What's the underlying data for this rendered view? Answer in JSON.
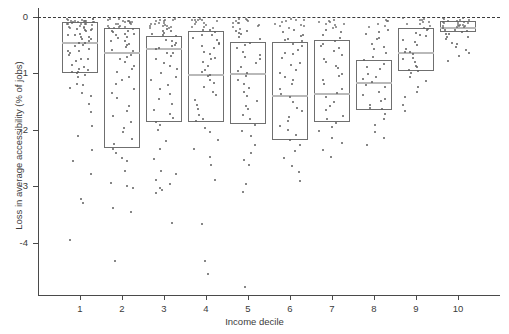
{
  "chart_data": {
    "type": "box",
    "title": "",
    "xlabel": "Income decile",
    "ylabel": "Loss in average accessibility (% of jobs)",
    "categories": [
      "1",
      "2",
      "3",
      "4",
      "5",
      "6",
      "7",
      "8",
      "9",
      "10"
    ],
    "xtick_labels": [
      "1",
      "2",
      "3",
      "4",
      "5",
      "6",
      "7",
      "8",
      "9",
      "10"
    ],
    "ytick_labels": [
      "0",
      "-1",
      "-2",
      "-3",
      "-4"
    ],
    "ytick_values": [
      0,
      -1,
      -2,
      -3,
      -4
    ],
    "ylim": [
      -4.9,
      0.15
    ],
    "xlim": [
      0.4,
      10.6
    ],
    "grid": false,
    "legend": null,
    "reference_lines": [
      {
        "axis": "y",
        "value": 0,
        "style": "dashed",
        "color": "#3b3b3b"
      }
    ],
    "overlay": "jittered scatter points of individual observations",
    "box_color": "#6f6f6f",
    "median_color": "#b9b9b9",
    "point_color": "#5e5e5e",
    "boxes": [
      {
        "category": "1",
        "q3": -0.09,
        "median": -0.45,
        "q1": -0.99
      },
      {
        "category": "2",
        "q3": -0.2,
        "median": -0.62,
        "q1": -2.32
      },
      {
        "category": "3",
        "q3": -0.34,
        "median": -0.55,
        "q1": -1.86
      },
      {
        "category": "4",
        "q3": -0.25,
        "median": -1.01,
        "q1": -1.86
      },
      {
        "category": "5",
        "q3": -0.45,
        "median": -0.99,
        "q1": -1.9
      },
      {
        "category": "6",
        "q3": -0.44,
        "median": -1.38,
        "q1": -2.18
      },
      {
        "category": "7",
        "q3": -0.41,
        "median": -1.35,
        "q1": -1.86
      },
      {
        "category": "8",
        "q3": -0.76,
        "median": -1.15,
        "q1": -1.65
      },
      {
        "category": "9",
        "q3": -0.2,
        "median": -0.62,
        "q1": -0.96
      },
      {
        "category": "10",
        "q3": -0.07,
        "median": -0.18,
        "q1": -0.27
      }
    ],
    "points": {
      "1": [
        -0.02,
        -0.03,
        -0.04,
        -0.05,
        -0.05,
        -0.06,
        -0.07,
        -0.07,
        -0.08,
        -0.08,
        -0.09,
        -0.09,
        -0.1,
        -0.1,
        -0.11,
        -0.12,
        -0.12,
        -0.13,
        -0.14,
        -0.15,
        -0.15,
        -0.16,
        -0.17,
        -0.18,
        -0.19,
        -0.2,
        -0.21,
        -0.22,
        -0.23,
        -0.25,
        -0.26,
        -0.28,
        -0.3,
        -0.32,
        -0.34,
        -0.36,
        -0.38,
        -0.4,
        -0.42,
        -0.45,
        -0.47,
        -0.5,
        -0.53,
        -0.56,
        -0.58,
        -0.61,
        -0.64,
        -0.68,
        -0.72,
        -0.76,
        -0.8,
        -0.85,
        -0.9,
        -0.93,
        -0.95,
        -0.97,
        -0.99,
        -1.0,
        -1.02,
        -1.05,
        -1.18,
        -1.22,
        -1.27,
        -1.35,
        -1.4,
        -1.52,
        -1.7,
        -1.95,
        -2.1,
        -2.35,
        -2.55,
        -2.78,
        -3.22,
        -3.27,
        -3.95
      ],
      "2": [
        -0.03,
        -0.04,
        -0.05,
        -0.06,
        -0.07,
        -0.08,
        -0.08,
        -0.09,
        -0.1,
        -0.11,
        -0.12,
        -0.13,
        -0.14,
        -0.15,
        -0.16,
        -0.17,
        -0.18,
        -0.19,
        -0.2,
        -0.21,
        -0.23,
        -0.25,
        -0.27,
        -0.29,
        -0.31,
        -0.33,
        -0.36,
        -0.38,
        -0.41,
        -0.44,
        -0.47,
        -0.5,
        -0.54,
        -0.58,
        -0.62,
        -0.66,
        -0.7,
        -0.75,
        -0.8,
        -0.86,
        -0.92,
        -0.98,
        -1.05,
        -1.12,
        -1.2,
        -1.28,
        -1.36,
        -1.45,
        -1.55,
        -1.65,
        -1.75,
        -1.86,
        -1.97,
        -2.05,
        -2.15,
        -2.25,
        -2.32,
        -2.4,
        -2.48,
        -2.56,
        -2.72,
        -2.95,
        -3.0,
        -3.05,
        -3.38,
        -3.45,
        -4.32
      ],
      "3": [
        -0.03,
        -0.04,
        -0.05,
        -0.06,
        -0.07,
        -0.08,
        -0.09,
        -0.1,
        -0.11,
        -0.12,
        -0.13,
        -0.14,
        -0.15,
        -0.16,
        -0.17,
        -0.18,
        -0.2,
        -0.22,
        -0.24,
        -0.26,
        -0.28,
        -0.3,
        -0.33,
        -0.36,
        -0.39,
        -0.42,
        -0.45,
        -0.48,
        -0.52,
        -0.55,
        -0.58,
        -0.62,
        -0.66,
        -0.7,
        -0.75,
        -0.8,
        -0.86,
        -0.92,
        -0.98,
        -1.05,
        -1.12,
        -1.2,
        -1.28,
        -1.36,
        -1.45,
        -1.54,
        -1.63,
        -1.72,
        -1.8,
        -1.86,
        -1.92,
        -2.0,
        -2.18,
        -2.35,
        -2.52,
        -2.72,
        -2.78,
        -2.88,
        -2.95,
        -3.02,
        -3.08,
        -3.12,
        -3.65
      ],
      "4": [
        -0.03,
        -0.04,
        -0.05,
        -0.06,
        -0.07,
        -0.08,
        -0.09,
        -0.1,
        -0.12,
        -0.14,
        -0.16,
        -0.18,
        -0.2,
        -0.22,
        -0.25,
        -0.28,
        -0.31,
        -0.34,
        -0.37,
        -0.4,
        -0.44,
        -0.48,
        -0.52,
        -0.56,
        -0.6,
        -0.65,
        -0.7,
        -0.75,
        -0.8,
        -0.86,
        -0.92,
        -0.98,
        -1.01,
        -1.06,
        -1.12,
        -1.18,
        -1.25,
        -1.32,
        -1.4,
        -1.48,
        -1.56,
        -1.64,
        -1.72,
        -1.8,
        -1.86,
        -1.95,
        -2.05,
        -2.18,
        -2.32,
        -2.48,
        -2.62,
        -2.9,
        -3.68,
        -4.3,
        -4.55
      ],
      "5": [
        -0.04,
        -0.05,
        -0.06,
        -0.07,
        -0.08,
        -0.09,
        -0.1,
        -0.12,
        -0.14,
        -0.16,
        -0.18,
        -0.2,
        -0.23,
        -0.26,
        -0.29,
        -0.32,
        -0.36,
        -0.4,
        -0.45,
        -0.5,
        -0.55,
        -0.6,
        -0.65,
        -0.7,
        -0.76,
        -0.82,
        -0.88,
        -0.94,
        -0.99,
        -1.05,
        -1.11,
        -1.18,
        -1.25,
        -1.32,
        -1.4,
        -1.48,
        -1.56,
        -1.64,
        -1.72,
        -1.8,
        -1.9,
        -2.0,
        -2.12,
        -2.25,
        -2.4,
        -2.55,
        -2.62,
        -2.95,
        -3.12,
        -4.78
      ],
      "6": [
        -0.04,
        -0.05,
        -0.06,
        -0.07,
        -0.09,
        -0.11,
        -0.13,
        -0.15,
        -0.17,
        -0.2,
        -0.23,
        -0.26,
        -0.3,
        -0.34,
        -0.38,
        -0.42,
        -0.44,
        -0.48,
        -0.53,
        -0.58,
        -0.63,
        -0.68,
        -0.74,
        -0.8,
        -0.86,
        -0.92,
        -0.99,
        -1.06,
        -1.13,
        -1.2,
        -1.28,
        -1.36,
        -1.44,
        -1.52,
        -1.6,
        -1.68,
        -1.76,
        -1.84,
        -1.92,
        -2.0,
        -2.08,
        -2.18,
        -2.28,
        -2.38,
        -2.5,
        -2.62,
        -2.75,
        -2.92
      ],
      "7": [
        -0.04,
        -0.05,
        -0.07,
        -0.09,
        -0.11,
        -0.13,
        -0.15,
        -0.18,
        -0.21,
        -0.24,
        -0.28,
        -0.32,
        -0.36,
        -0.41,
        -0.46,
        -0.51,
        -0.56,
        -0.61,
        -0.67,
        -0.73,
        -0.79,
        -0.85,
        -0.92,
        -0.99,
        -1.06,
        -1.13,
        -1.2,
        -1.28,
        -1.35,
        -1.42,
        -1.5,
        -1.58,
        -1.66,
        -1.74,
        -1.82,
        -1.86,
        -1.94,
        -2.02,
        -2.12,
        -2.22,
        -2.35,
        -2.48
      ],
      "8": [
        -0.05,
        -0.07,
        -0.09,
        -0.12,
        -0.15,
        -0.18,
        -0.22,
        -0.26,
        -0.3,
        -0.35,
        -0.4,
        -0.46,
        -0.52,
        -0.58,
        -0.64,
        -0.7,
        -0.76,
        -0.82,
        -0.88,
        -0.94,
        -1.0,
        -1.06,
        -1.1,
        -1.15,
        -1.2,
        -1.26,
        -1.32,
        -1.38,
        -1.44,
        -1.5,
        -1.56,
        -1.62,
        -1.65,
        -1.72,
        -1.8,
        -1.9,
        -2.02,
        -2.15,
        -2.28
      ],
      "9": [
        -0.03,
        -0.04,
        -0.05,
        -0.06,
        -0.08,
        -0.1,
        -0.12,
        -0.14,
        -0.16,
        -0.19,
        -0.2,
        -0.23,
        -0.27,
        -0.31,
        -0.35,
        -0.4,
        -0.45,
        -0.5,
        -0.55,
        -0.6,
        -0.62,
        -0.66,
        -0.71,
        -0.76,
        -0.81,
        -0.86,
        -0.9,
        -0.94,
        -0.96,
        -1.0,
        -1.06,
        -1.14,
        -1.22,
        -1.32,
        -1.42,
        -1.54,
        -1.68
      ],
      "10": [
        -0.02,
        -0.03,
        -0.04,
        -0.05,
        -0.06,
        -0.07,
        -0.07,
        -0.08,
        -0.09,
        -0.1,
        -0.11,
        -0.12,
        -0.13,
        -0.14,
        -0.15,
        -0.16,
        -0.17,
        -0.18,
        -0.19,
        -0.2,
        -0.21,
        -0.22,
        -0.23,
        -0.25,
        -0.27,
        -0.29,
        -0.31,
        -0.34,
        -0.37,
        -0.4,
        -0.44,
        -0.48,
        -0.53,
        -0.58,
        -0.64,
        -0.7,
        -0.78
      ]
    }
  },
  "axes": {
    "y_tick_0": "0",
    "y_tick_1": "-1",
    "y_tick_2": "-2",
    "y_tick_3": "-3",
    "y_tick_4": "-4",
    "x_tick_1": "1",
    "x_tick_2": "2",
    "x_tick_3": "3",
    "x_tick_4": "4",
    "x_tick_5": "5",
    "x_tick_6": "6",
    "x_tick_7": "7",
    "x_tick_8": "8",
    "x_tick_9": "9",
    "x_tick_10": "10",
    "x_axis_title": "Income decile",
    "y_axis_title": "Loss in average accessibility (% of jobs)"
  }
}
